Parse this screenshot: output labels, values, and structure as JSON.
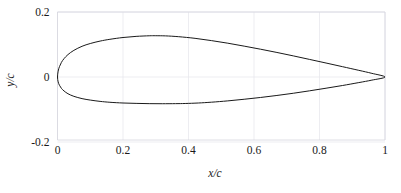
{
  "chart_data": {
    "type": "line",
    "title": "",
    "subtitle": "",
    "xlabel": "x/c",
    "ylabel": "y/c",
    "xlim": [
      0,
      1
    ],
    "ylim": [
      -0.2,
      0.2
    ],
    "xticks": [
      0,
      0.2,
      0.4,
      0.6,
      0.8,
      1
    ],
    "xticklabels": [
      "0",
      "0.2",
      "0.4",
      "0.6",
      "0.8",
      "1"
    ],
    "yticks": [
      -0.2,
      0,
      0.2
    ],
    "yticklabels": [
      "-0.2",
      "0",
      "0.2"
    ],
    "grid": true,
    "grid_color": "#e8e8ee",
    "legend": null,
    "line_color": "#1a1a1a",
    "line_width": 1,
    "annotations": [],
    "series": [
      {
        "name": "airfoil-profile",
        "closed": true,
        "description": "Airfoil section contour, upper surface then lower surface, closed at trailing edge",
        "upper_surface": {
          "x": [
            0.0,
            0.002,
            0.006,
            0.012,
            0.02,
            0.032,
            0.05,
            0.075,
            0.1,
            0.13,
            0.16,
            0.2,
            0.24,
            0.28,
            0.3,
            0.33,
            0.37,
            0.42,
            0.47,
            0.52,
            0.57,
            0.62,
            0.67,
            0.72,
            0.77,
            0.82,
            0.87,
            0.92,
            0.96,
            1.0
          ],
          "y": [
            0.0,
            0.018,
            0.032,
            0.045,
            0.0565,
            0.069,
            0.082,
            0.0945,
            0.103,
            0.1105,
            0.116,
            0.1215,
            0.125,
            0.1268,
            0.127,
            0.1265,
            0.124,
            0.119,
            0.112,
            0.104,
            0.095,
            0.0855,
            0.0755,
            0.065,
            0.054,
            0.043,
            0.0318,
            0.0205,
            0.0112,
            0.0
          ]
        },
        "lower_surface": {
          "x": [
            0.0,
            0.002,
            0.006,
            0.012,
            0.02,
            0.032,
            0.05,
            0.075,
            0.1,
            0.13,
            0.16,
            0.2,
            0.24,
            0.28,
            0.32,
            0.36,
            0.39,
            0.43,
            0.47,
            0.52,
            0.57,
            0.62,
            0.67,
            0.72,
            0.77,
            0.82,
            0.87,
            0.92,
            0.96,
            1.0
          ],
          "y": [
            0.0,
            -0.015,
            -0.0255,
            -0.035,
            -0.043,
            -0.0515,
            -0.0595,
            -0.0665,
            -0.071,
            -0.075,
            -0.0778,
            -0.08,
            -0.0812,
            -0.082,
            -0.0822,
            -0.082,
            -0.0815,
            -0.08,
            -0.0775,
            -0.0735,
            -0.0685,
            -0.063,
            -0.0568,
            -0.05,
            -0.0425,
            -0.0345,
            -0.0262,
            -0.0172,
            -0.0096,
            0.0
          ]
        },
        "key_points": {
          "leading_edge": [
            0.0,
            0.0
          ],
          "trailing_edge": [
            1.0,
            0.0
          ],
          "max_upper_thickness": [
            0.3,
            0.127
          ],
          "max_lower_thickness": [
            0.32,
            -0.082
          ]
        }
      }
    ]
  },
  "figure": {
    "background_color": "#ffffff",
    "axis_color": "#d6d6de",
    "text_color": "#1a1a1a"
  }
}
